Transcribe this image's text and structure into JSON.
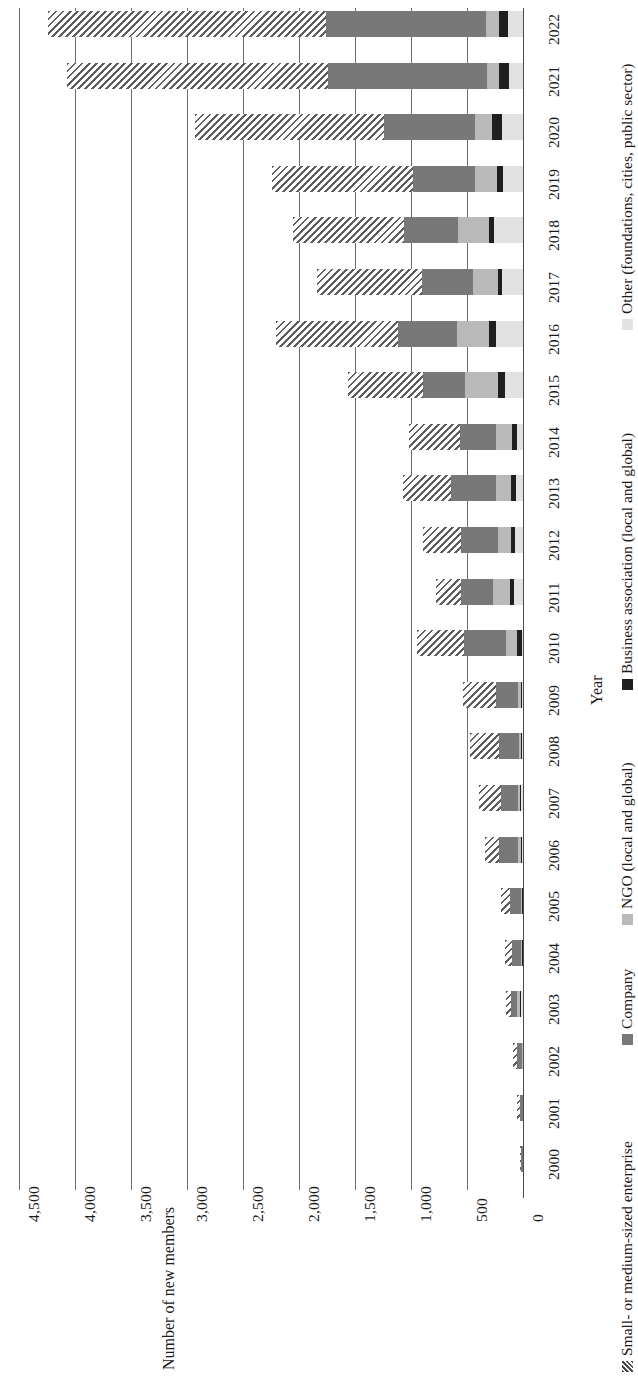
{
  "chart_data": {
    "type": "bar",
    "orientation": "stacked-column-rotated",
    "title": "",
    "xlabel": "Year",
    "ylabel": "Number of new members",
    "ylim": [
      0,
      4500
    ],
    "yticks": [
      "0",
      "500",
      "1,000",
      "1,500",
      "2,000",
      "2,500",
      "3,000",
      "3,500",
      "4,000",
      "4,500"
    ],
    "ytick_values": [
      0,
      500,
      1000,
      1500,
      2000,
      2500,
      3000,
      3500,
      4000,
      4500
    ],
    "grid": true,
    "legend_position": "bottom",
    "categories": [
      "2000",
      "2001",
      "2002",
      "2003",
      "2004",
      "2005",
      "2006",
      "2007",
      "2008",
      "2009",
      "2010",
      "2011",
      "2012",
      "2013",
      "2014",
      "2015",
      "2016",
      "2017",
      "2018",
      "2019",
      "2020",
      "2021",
      "2022"
    ],
    "series": [
      {
        "name": "Small- or medium-sized enterprise",
        "key": "sme",
        "color": "#5d5d5d",
        "pattern": "diagonal-hatch",
        "values": [
          10,
          25,
          40,
          50,
          60,
          80,
          120,
          190,
          260,
          300,
          420,
          230,
          340,
          430,
          455,
          670,
          1090,
          930,
          990,
          1260,
          1680,
          2330,
          2480
        ]
      },
      {
        "name": "Company",
        "key": "company",
        "color": "#787878",
        "values": [
          15,
          30,
          45,
          55,
          80,
          95,
          170,
          155,
          175,
          195,
          375,
          285,
          330,
          400,
          320,
          375,
          525,
          455,
          485,
          555,
          820,
          1420,
          1430
        ]
      },
      {
        "name": "NGO (local and global)",
        "key": "ngo",
        "color": "#b9b9b9",
        "values": [
          0,
          0,
          5,
          20,
          10,
          10,
          25,
          20,
          15,
          25,
          95,
          145,
          110,
          135,
          140,
          295,
          285,
          230,
          275,
          195,
          150,
          110,
          115
        ]
      },
      {
        "name": "Business association (local and global)",
        "key": "ba",
        "color": "#1f1f1f",
        "values": [
          0,
          0,
          0,
          5,
          5,
          5,
          10,
          10,
          10,
          10,
          50,
          40,
          40,
          45,
          45,
          60,
          60,
          35,
          45,
          60,
          90,
          90,
          80
        ]
      },
      {
        "name": "Other (foundations, cities, public sector)",
        "key": "other",
        "color": "#e2e2e2",
        "values": [
          0,
          0,
          0,
          25,
          5,
          5,
          10,
          15,
          10,
          10,
          5,
          80,
          70,
          60,
          55,
          160,
          245,
          185,
          260,
          175,
          185,
          125,
          135
        ]
      }
    ]
  },
  "legend": {
    "items": [
      {
        "label": "Small- or medium-sized enterprise",
        "key": "sme"
      },
      {
        "label": "Company",
        "key": "company"
      },
      {
        "label": "NGO (local and global)",
        "key": "ngo"
      },
      {
        "label": "Business association (local and global)",
        "key": "ba"
      },
      {
        "label": "Other (foundations, cities, public sector)",
        "key": "other"
      }
    ]
  }
}
